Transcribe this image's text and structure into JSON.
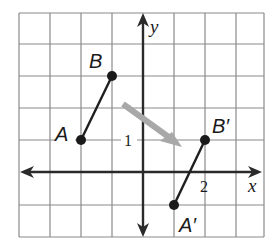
{
  "diagram": {
    "type": "coordinate-grid-translation",
    "grid": {
      "x_range": [
        -4,
        4
      ],
      "y_range": [
        -2,
        5
      ],
      "cell_px": 31,
      "origin_px": [
        143,
        172
      ],
      "line_color": "#8a8a8a",
      "axis_color": "#2a2a2a"
    },
    "axes": {
      "x_label": "x",
      "y_label": "y",
      "tick_labels": [
        {
          "axis": "x",
          "value": 2,
          "text": "2"
        },
        {
          "axis": "y",
          "value": 1,
          "text": "1"
        }
      ]
    },
    "points": [
      {
        "name": "A",
        "label": "A",
        "x": -2,
        "y": 1
      },
      {
        "name": "B",
        "label": "B",
        "x": -1,
        "y": 3
      },
      {
        "name": "A-prime",
        "label": "A′",
        "x": 1,
        "y": -1
      },
      {
        "name": "B-prime",
        "label": "B′",
        "x": 2,
        "y": 1
      }
    ],
    "segments": [
      {
        "from": "A",
        "to": "B"
      },
      {
        "from": "A-prime",
        "to": "B-prime"
      }
    ],
    "translation_arrow": {
      "color": "#a8a8a8",
      "from_px": [
        123,
        104
      ],
      "to_px": [
        181,
        146
      ]
    }
  }
}
